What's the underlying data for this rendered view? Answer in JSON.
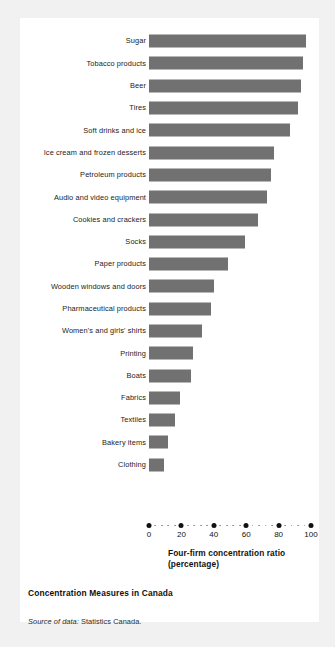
{
  "figure": {
    "title": "Concentration Measures in Canada",
    "source_lead": "Source of data:",
    "source_body": " Statistics Canada.",
    "bar_color": "#717171",
    "panel_color": "#ffffff",
    "page_color": "#f1f1f1"
  },
  "axis": {
    "title_line1": "Four-firm concentration ratio",
    "title_line2": "(percentage)",
    "tick_labels": [
      "0",
      "20",
      "40",
      "60",
      "80",
      "100"
    ],
    "tick_values": [
      0,
      20,
      40,
      60,
      80,
      100
    ],
    "minor_step": 4
  },
  "chart_data": {
    "type": "bar",
    "orientation": "horizontal",
    "title": "Concentration Measures in Canada",
    "xlabel": "Four-firm concentration ratio (percentage)",
    "ylabel": "",
    "xlim": [
      0,
      100
    ],
    "grid": false,
    "legend": "none",
    "categories": [
      "Sugar",
      "Tobacco products",
      "Beer",
      "Tires",
      "Soft drinks and ice",
      "Ice cream and frozen desserts",
      "Petroleum products",
      "Audio and video equipment",
      "Cookies and crackers",
      "Socks",
      "Paper products",
      "Wooden windows and doors",
      "Pharmaceutical products",
      "Women's and girls' shirts",
      "Printing",
      "Boats",
      "Fabrics",
      "Textiles",
      "Bakery items",
      "Clothing"
    ],
    "values": [
      97,
      95,
      94,
      92,
      87,
      77,
      75,
      73,
      67,
      59,
      49,
      40,
      38,
      33,
      27,
      26,
      19,
      16,
      12,
      9
    ],
    "source": "Source of data: Statistics Canada."
  }
}
